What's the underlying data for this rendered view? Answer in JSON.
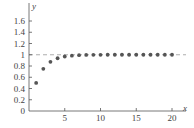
{
  "chart_data": {
    "type": "scatter",
    "title": "",
    "xlabel": "x",
    "ylabel": "y",
    "xlim": [
      0,
      21.5
    ],
    "ylim": [
      0,
      1.7
    ],
    "xticks": [
      5,
      10,
      15,
      20
    ],
    "yticks": [
      0,
      0.2,
      0.4,
      0.6,
      0.8,
      1,
      1.2,
      1.4,
      1.6
    ],
    "ytick_labels": [
      "0",
      "0.2",
      "0.4",
      "0.6",
      "0.8",
      "1",
      "1.2",
      "1.4",
      "1.6"
    ],
    "grid": false,
    "legend": null,
    "asymptote": {
      "y": 1,
      "style": "dashed"
    },
    "series": [
      {
        "name": "sequence",
        "x": [
          1,
          2,
          3,
          4,
          5,
          6,
          7,
          8,
          9,
          10,
          11,
          12,
          13,
          14,
          15,
          16,
          17,
          18,
          19,
          20
        ],
        "y": [
          0.5,
          0.75,
          0.875,
          0.938,
          0.969,
          0.984,
          0.992,
          0.996,
          0.998,
          0.999,
          1.0,
          1.0,
          1.0,
          1.0,
          1.0,
          1.0,
          1.0,
          1.0,
          1.0,
          1.0
        ]
      }
    ]
  },
  "colors": {
    "axis": "#555555",
    "points": "#555555",
    "asymptote": "#999999"
  }
}
